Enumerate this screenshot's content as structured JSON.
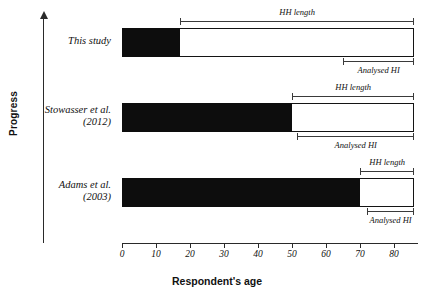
{
  "chart_data": {
    "type": "bar",
    "title": "",
    "subtitle": "",
    "xlabel": "Respondent's age",
    "ylabel": "Progress",
    "xlim": [
      0,
      87
    ],
    "ylim": null,
    "grid": false,
    "legend": null,
    "orientation": "horizontal",
    "xticks": [
      0,
      10,
      20,
      30,
      40,
      50,
      60,
      70,
      80
    ],
    "xtick_labels": [
      "0",
      "10",
      "20",
      "30",
      "40",
      "50",
      "60",
      "70",
      "80"
    ],
    "categories": [
      "This study",
      "Stowasser et al. (2012)",
      "Adams et al. (2003)"
    ],
    "bars": [
      {
        "category": "This study",
        "category_lines": [
          "This study"
        ],
        "filled_start": 0,
        "filled_end": 17,
        "total_start": 0,
        "total_end": 86,
        "annotations": [
          {
            "label": "HH length",
            "start": 17,
            "end": 86,
            "position": "above"
          },
          {
            "label": "Analysed HI",
            "start": 65,
            "end": 86,
            "position": "below"
          }
        ]
      },
      {
        "category": "Stowasser et al. (2012)",
        "category_lines": [
          "Stowasser et al.",
          "(2012)"
        ],
        "filled_start": 0,
        "filled_end": 50,
        "total_start": 0,
        "total_end": 86,
        "annotations": [
          {
            "label": "HH length",
            "start": 50,
            "end": 86,
            "position": "above"
          },
          {
            "label": "Analysed HI",
            "start": 51.5,
            "end": 86,
            "position": "below"
          }
        ]
      },
      {
        "category": "Adams et al. (2003)",
        "category_lines": [
          "Adams et al.",
          "(2003)"
        ],
        "filled_start": 0,
        "filled_end": 70,
        "total_start": 0,
        "total_end": 86,
        "annotations": [
          {
            "label": "HH length",
            "start": 70,
            "end": 86,
            "position": "above"
          },
          {
            "label": "Analysed HI",
            "start": 72,
            "end": 86,
            "position": "below"
          }
        ]
      }
    ],
    "colors": {
      "filled": "#0d0d0d",
      "unfilled": "#ffffff",
      "outline": "#141414",
      "axis": "#2a2a2a",
      "text": "#111111",
      "background": "#ffffff"
    }
  },
  "axes": {
    "y_axis_title": "Progress",
    "x_axis_title": "Respondent's age",
    "y_axis_arrow": "upward-arrow"
  },
  "rows": {
    "0": {
      "line1": "This study",
      "line2": ""
    },
    "1": {
      "line1": "Stowasser et al.",
      "line2": "(2012)"
    },
    "2": {
      "line1": "Adams et al.",
      "line2": "(2003)"
    }
  },
  "labels": {
    "hh_length": "HH length",
    "analysed_hi": "Analysed HI"
  }
}
